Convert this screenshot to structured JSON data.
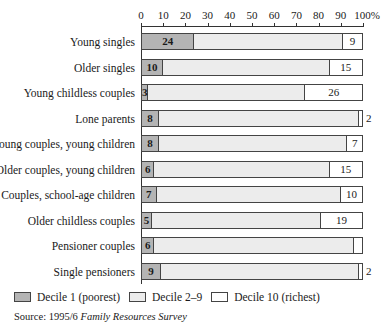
{
  "chart_data": {
    "type": "bar",
    "orientation": "horizontal",
    "stacked": true,
    "title": "",
    "xlabel": "",
    "ylabel": "",
    "xlim": [
      0,
      100
    ],
    "x_ticks": [
      "0",
      "10",
      "20",
      "30",
      "40",
      "50",
      "60",
      "70",
      "80",
      "90",
      "100%"
    ],
    "grid": false,
    "legend_position": "bottom",
    "categories": [
      "Young singles",
      "Older singles",
      "Young childless couples",
      "Lone parents",
      "Young couples, young children",
      "Older couples, young children",
      "Couples, school-age children",
      "Older childless couples",
      "Pensioner couples",
      "Single pensioners"
    ],
    "series": [
      {
        "name": "Decile 1 (poorest)",
        "color": "#b4b4b4",
        "values": [
          24,
          10,
          3,
          8,
          8,
          6,
          7,
          5,
          6,
          9
        ]
      },
      {
        "name": "Decile 2–9",
        "color": "#ececec",
        "values": [
          67,
          75,
          71,
          90,
          85,
          79,
          83,
          76,
          90,
          89
        ]
      },
      {
        "name": "Decile 10 (richest)",
        "color": "#ffffff",
        "values": [
          9,
          15,
          26,
          2,
          7,
          15,
          10,
          19,
          4,
          2
        ]
      }
    ]
  },
  "labels": {
    "legend": [
      "Decile 1 (poorest)",
      "Decile 2–9",
      "Decile 10 (richest)"
    ],
    "source_prefix": "Source: 1995/6 ",
    "source_title": "Family Resources Survey"
  }
}
